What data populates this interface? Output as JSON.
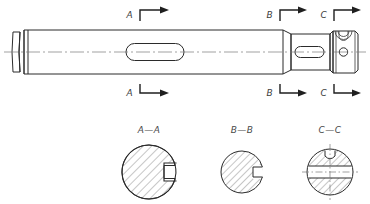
{
  "drawing": {
    "title": "Stepped shaft with keyway and cross-hole",
    "type": "engineering-orthographic-drawing",
    "background_color": "#ffffff",
    "line_color": "#2b2b2b",
    "centerline_color": "#7a7a7a",
    "hatch_color": "#5a5a5a"
  },
  "section_markers": {
    "top": [
      {
        "id": "A",
        "label": "A",
        "x": 136,
        "y": 14,
        "arrow_direction": "right"
      },
      {
        "id": "B",
        "label": "B",
        "x": 276,
        "y": 14,
        "arrow_direction": "right"
      },
      {
        "id": "C",
        "label": "C",
        "x": 330,
        "y": 14,
        "arrow_direction": "right"
      }
    ],
    "bottom": [
      {
        "id": "A",
        "label": "A",
        "x": 136,
        "y": 94,
        "arrow_direction": "right"
      },
      {
        "id": "B",
        "label": "B",
        "x": 276,
        "y": 94,
        "arrow_direction": "right"
      },
      {
        "id": "C",
        "label": "C",
        "x": 330,
        "y": 94,
        "arrow_direction": "right"
      }
    ]
  },
  "section_views": [
    {
      "id": "A-A",
      "label": "A—A",
      "label_x": 149,
      "label_y": 131,
      "center_x": 149,
      "center_y": 172,
      "radius": 27,
      "notch": "rectangular-keyway-right",
      "hatched": true
    },
    {
      "id": "B-B",
      "label": "B—B",
      "label_x": 242,
      "label_y": 131,
      "center_x": 242,
      "center_y": 172,
      "radius": 21,
      "notch": "rectangular-keyway-right",
      "hatched": true
    },
    {
      "id": "C-C",
      "label": "C—C",
      "label_x": 330,
      "label_y": 131,
      "center_x": 330,
      "center_y": 172,
      "radius": 23,
      "notch": "top-slot-and-horizontal-through-slot",
      "hatched": true
    }
  ],
  "main_view": {
    "axis_y": 52,
    "left_end_x": 12,
    "right_end_x": 358,
    "features": [
      {
        "name": "end-collar-groove",
        "x": 12,
        "width": 18,
        "diameter": 50
      },
      {
        "name": "main-shaft-body",
        "x": 30,
        "width": 253,
        "diameter": 50
      },
      {
        "name": "taper-step",
        "x": 283,
        "width": 8,
        "diameter": 36
      },
      {
        "name": "reduced-shaft",
        "x": 291,
        "width": 39,
        "diameter": 36
      },
      {
        "name": "end-block",
        "x": 332,
        "width": 26,
        "diameter": 44
      }
    ],
    "slots": [
      {
        "name": "main-keyway-slot",
        "cx": 155,
        "cy": 52,
        "length": 58,
        "height": 17
      },
      {
        "name": "secondary-keyway-slot",
        "cx": 305,
        "cy": 52,
        "length": 28,
        "height": 11
      }
    ],
    "cross_hole": {
      "name": "cross-hole",
      "cx": 343,
      "cy": 52,
      "r": 4
    },
    "top_recess": {
      "name": "top-arc-recess",
      "cx": 343,
      "cy": 33,
      "r": 8
    }
  }
}
